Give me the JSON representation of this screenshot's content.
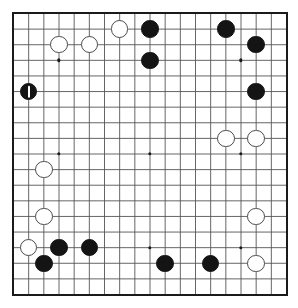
{
  "board": {
    "name": "go-board",
    "size": 19,
    "line_color": "#555555",
    "border_color": "#1a1a1a",
    "background_color": "#ffffff",
    "black_color": "#141414",
    "white_color": "#ffffff",
    "white_edge_color": "#4a4a4a",
    "star_points": [
      {
        "col": 4,
        "row": 4
      },
      {
        "col": 10,
        "row": 4
      },
      {
        "col": 16,
        "row": 4
      },
      {
        "col": 4,
        "row": 10
      },
      {
        "col": 10,
        "row": 10
      },
      {
        "col": 16,
        "row": 10
      },
      {
        "col": 4,
        "row": 16
      },
      {
        "col": 10,
        "row": 16
      },
      {
        "col": 16,
        "row": 16
      }
    ],
    "stones": [
      {
        "col": 8,
        "row": 2,
        "color": "white",
        "marked": false
      },
      {
        "col": 10,
        "row": 2,
        "color": "black",
        "marked": false
      },
      {
        "col": 15,
        "row": 2,
        "color": "black",
        "marked": false
      },
      {
        "col": 4,
        "row": 3,
        "color": "white",
        "marked": false
      },
      {
        "col": 6,
        "row": 3,
        "color": "white",
        "marked": false
      },
      {
        "col": 17,
        "row": 3,
        "color": "black",
        "marked": false
      },
      {
        "col": 10,
        "row": 4,
        "color": "black",
        "marked": false
      },
      {
        "col": 2,
        "row": 6,
        "color": "black",
        "marked": true
      },
      {
        "col": 17,
        "row": 6,
        "color": "black",
        "marked": false
      },
      {
        "col": 15,
        "row": 9,
        "color": "white",
        "marked": false
      },
      {
        "col": 17,
        "row": 9,
        "color": "white",
        "marked": false
      },
      {
        "col": 3,
        "row": 11,
        "color": "white",
        "marked": false
      },
      {
        "col": 3,
        "row": 14,
        "color": "white",
        "marked": false
      },
      {
        "col": 17,
        "row": 14,
        "color": "white",
        "marked": false
      },
      {
        "col": 2,
        "row": 16,
        "color": "white",
        "marked": false
      },
      {
        "col": 4,
        "row": 16,
        "color": "black",
        "marked": false
      },
      {
        "col": 6,
        "row": 16,
        "color": "black",
        "marked": false
      },
      {
        "col": 3,
        "row": 17,
        "color": "black",
        "marked": false
      },
      {
        "col": 11,
        "row": 17,
        "color": "black",
        "marked": false
      },
      {
        "col": 14,
        "row": 17,
        "color": "black",
        "marked": false
      },
      {
        "col": 17,
        "row": 17,
        "color": "white",
        "marked": false
      }
    ]
  }
}
